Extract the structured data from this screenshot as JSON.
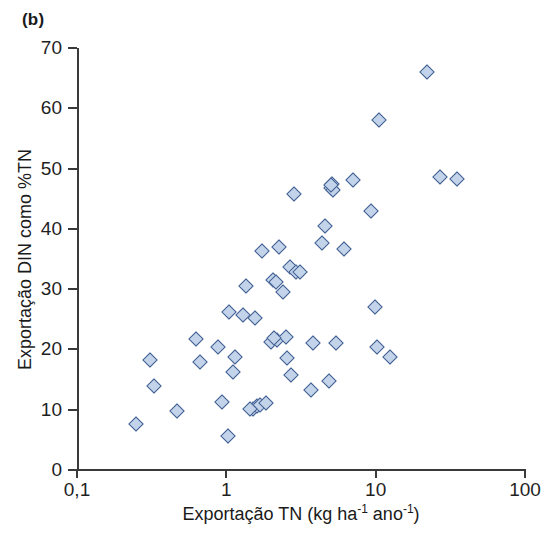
{
  "panel": {
    "label": "(b)"
  },
  "chart_data": {
    "type": "scatter",
    "title": "",
    "panel_label": "(b)",
    "xlabel": "Exportação TN (kg ha⁻¹ ano⁻¹)",
    "xlabel_parts": {
      "prefix": "Exportação TN (kg ha",
      "sup1": "-1",
      "middle": " ano",
      "sup2": "-1",
      "suffix": ")"
    },
    "ylabel": "Exportação DIN como %TN",
    "xscale": "log",
    "yscale": "linear",
    "xlim": [
      0.1,
      100
    ],
    "ylim": [
      0,
      70
    ],
    "xticks": [
      0.1,
      1,
      10,
      100
    ],
    "xticklabels": [
      "0,1",
      "1",
      "10",
      "100"
    ],
    "yticks": [
      0,
      10,
      20,
      30,
      40,
      50,
      60,
      70
    ],
    "yticklabels": [
      "0",
      "10",
      "20",
      "30",
      "40",
      "50",
      "60",
      "70"
    ],
    "grid": false,
    "legend": null,
    "marker": {
      "shape": "diamond",
      "fill_color": "#c2d3ea",
      "edge_color": "#3f5e90",
      "size_px": 12
    },
    "n_points": 55,
    "points": [
      [
        0.25,
        7.6
      ],
      [
        0.31,
        18.2
      ],
      [
        0.33,
        14.0
      ],
      [
        0.47,
        9.8
      ],
      [
        0.63,
        21.8
      ],
      [
        0.67,
        17.9
      ],
      [
        0.88,
        20.4
      ],
      [
        0.93,
        11.3
      ],
      [
        1.03,
        5.6
      ],
      [
        1.05,
        26.2
      ],
      [
        1.1,
        16.3
      ],
      [
        1.15,
        18.8
      ],
      [
        1.3,
        25.7
      ],
      [
        1.35,
        30.6
      ],
      [
        1.5,
        10.1
      ],
      [
        1.55,
        25.2
      ],
      [
        1.6,
        10.6
      ],
      [
        1.68,
        10.8
      ],
      [
        1.72,
        36.4
      ],
      [
        1.85,
        11.1
      ],
      [
        2.0,
        21.3
      ],
      [
        2.05,
        31.5
      ],
      [
        2.15,
        31.2
      ],
      [
        2.2,
        21.6
      ],
      [
        2.25,
        37.0
      ],
      [
        2.4,
        29.6
      ],
      [
        2.5,
        22.0
      ],
      [
        2.55,
        18.5
      ],
      [
        2.65,
        33.6
      ],
      [
        2.7,
        15.7
      ],
      [
        2.85,
        45.7
      ],
      [
        2.95,
        32.9
      ],
      [
        3.7,
        13.2
      ],
      [
        3.8,
        21.0
      ],
      [
        4.4,
        37.6
      ],
      [
        4.6,
        40.5
      ],
      [
        4.9,
        14.7
      ],
      [
        5.0,
        46.8
      ],
      [
        5.1,
        47.5
      ],
      [
        5.2,
        46.4
      ],
      [
        5.4,
        21.0
      ],
      [
        6.1,
        36.6
      ],
      [
        7.0,
        48.1
      ],
      [
        9.3,
        43.0
      ],
      [
        9.9,
        27.1
      ],
      [
        10.2,
        20.4
      ],
      [
        10.6,
        58.0
      ],
      [
        12.5,
        18.8
      ],
      [
        22.0,
        66.0
      ],
      [
        27.0,
        48.6
      ],
      [
        35.0,
        48.2
      ],
      [
        1.45,
        10.2
      ],
      [
        2.1,
        21.9
      ],
      [
        3.1,
        32.8
      ],
      [
        5.05,
        47.2
      ]
    ]
  }
}
